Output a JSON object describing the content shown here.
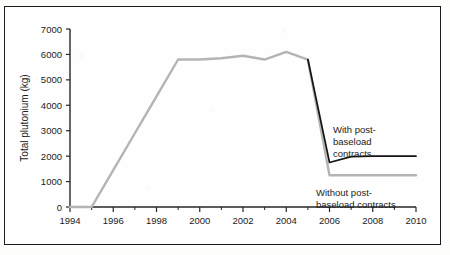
{
  "chart_data": {
    "type": "line",
    "title": "",
    "xlabel": "",
    "ylabel": "Total plutonium (kg)",
    "xlim": [
      1994,
      2010
    ],
    "ylim": [
      0,
      7000
    ],
    "grid": false,
    "legend": "annotations-inline",
    "xticks": [
      1994,
      1996,
      1998,
      2000,
      2002,
      2004,
      2006,
      2008,
      2010
    ],
    "xticks_minor": [
      1995,
      1997,
      1999,
      2001,
      2003,
      2005,
      2007,
      2009
    ],
    "yticks": [
      0,
      1000,
      2000,
      3000,
      4000,
      5000,
      6000,
      7000
    ],
    "x": [
      1994,
      1995,
      1996,
      1997,
      1998,
      1999,
      2000,
      2001,
      2002,
      2003,
      2004,
      2005,
      2006,
      2007,
      2008,
      2009,
      2010
    ],
    "series": [
      {
        "name": "Without post-baseload contracts",
        "color": "#b4b4b4",
        "values": [
          0,
          0,
          1450,
          2900,
          4350,
          5800,
          5800,
          5850,
          5950,
          5800,
          6100,
          5800,
          1250,
          1250,
          1250,
          1250,
          1250
        ]
      },
      {
        "name": "With post-baseload contracts",
        "color": "#141414",
        "values": [
          null,
          null,
          null,
          null,
          null,
          null,
          null,
          null,
          null,
          null,
          null,
          5800,
          1750,
          1980,
          2000,
          2000,
          2000
        ]
      }
    ],
    "annotations": [
      {
        "name": "with-post-baseload-annotation",
        "lines": [
          "With post-",
          "baseload",
          "contracts"
        ],
        "x": 2006.6,
        "y": 3400
      },
      {
        "name": "without-post-baseload-annotation",
        "lines": [
          "Without post-",
          "baseload  contracts"
        ],
        "x": 2006.1,
        "y": 700
      }
    ]
  },
  "axis": {
    "ylabel": "Total plutonium (kg)",
    "ytick_labels": [
      "0",
      "1000",
      "2000",
      "3000",
      "4000",
      "5000",
      "6000",
      "7000"
    ],
    "xtick_labels": [
      "1994",
      "1996",
      "1998",
      "2000",
      "2002",
      "2004",
      "2006",
      "2008",
      "2010"
    ]
  },
  "annotations": {
    "with_line1": "With post-",
    "with_line2": "baseload",
    "with_line3": "contracts",
    "without_line1": "Without post-",
    "without_line2": "baseload  contracts"
  },
  "colors": {
    "series_without": "#b4b4b4",
    "series_with": "#141414",
    "axis": "#262626",
    "frame": "#1b1b1b",
    "background": "#fefefe"
  }
}
